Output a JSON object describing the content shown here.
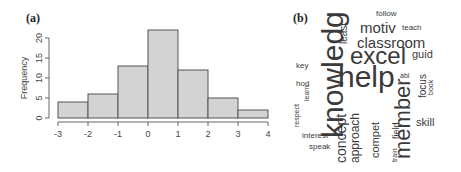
{
  "panels": {
    "a": {
      "label": "(a)"
    },
    "b": {
      "label": "(b)"
    }
  },
  "chart_data": [
    {
      "type": "bar",
      "subtype": "histogram",
      "title": "",
      "panel": "(a)",
      "xlabel": "",
      "ylabel": "Frequency",
      "bins": [
        [
          -3,
          -2
        ],
        [
          -2,
          -1
        ],
        [
          -1,
          0
        ],
        [
          0,
          1
        ],
        [
          1,
          2
        ],
        [
          2,
          3
        ],
        [
          3,
          4
        ]
      ],
      "categories": [
        "-3 to -2",
        "-2 to -1",
        "-1 to 0",
        "0 to 1",
        "1 to 2",
        "2 to 3",
        "3 to 4"
      ],
      "values": [
        4,
        6,
        13,
        22,
        12,
        5,
        2
      ],
      "xticks": [
        "-3",
        "-2",
        "-1",
        "0",
        "1",
        "2",
        "3",
        "4"
      ],
      "yticks": [
        "0",
        "5",
        "10",
        "15",
        "20"
      ],
      "xlim": [
        -3,
        4
      ],
      "ylim": [
        0,
        22
      ],
      "grid": false,
      "bar_color": "#d3d3d3",
      "edge_color": "#555555"
    },
    {
      "type": "wordcloud",
      "panel": "(b)",
      "words": [
        {
          "text": "knowledg",
          "size": 30,
          "rotated": true
        },
        {
          "text": "help",
          "size": 30,
          "rotated": false
        },
        {
          "text": "excel",
          "size": 24,
          "rotated": false
        },
        {
          "text": "member",
          "size": 22,
          "rotated": true
        },
        {
          "text": "classroom",
          "size": 15,
          "rotated": false
        },
        {
          "text": "motiv",
          "size": 15,
          "rotated": false
        },
        {
          "text": "concept",
          "size": 14,
          "rotated": true
        },
        {
          "text": "approach",
          "size": 12,
          "rotated": true
        },
        {
          "text": "compet",
          "size": 11,
          "rotated": true
        },
        {
          "text": "guid",
          "size": 11,
          "rotated": false
        },
        {
          "text": "skill",
          "size": 11,
          "rotated": false
        },
        {
          "text": "focus",
          "size": 10,
          "rotated": true
        },
        {
          "text": "least",
          "size": 10,
          "rotated": true
        },
        {
          "text": "field",
          "size": 9,
          "rotated": true
        },
        {
          "text": "follow",
          "size": 8,
          "rotated": false
        },
        {
          "text": "teach",
          "size": 8,
          "rotated": false
        },
        {
          "text": "key",
          "size": 8,
          "rotated": false
        },
        {
          "text": "hod",
          "size": 8,
          "rotated": false
        },
        {
          "text": "learn",
          "size": 7,
          "rotated": true
        },
        {
          "text": "respect",
          "size": 7,
          "rotated": true
        },
        {
          "text": "interest",
          "size": 8,
          "rotated": false
        },
        {
          "text": "speak",
          "size": 8,
          "rotated": false
        },
        {
          "text": "abl",
          "size": 7,
          "rotated": false
        },
        {
          "text": "book",
          "size": 7,
          "rotated": true
        },
        {
          "text": "train",
          "size": 7,
          "rotated": true
        }
      ]
    }
  ]
}
